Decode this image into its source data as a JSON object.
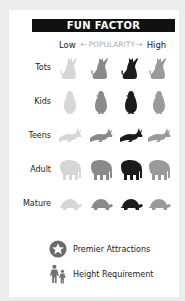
{
  "title": "FUN FACTOR",
  "scale": {
    "low": "Low",
    "middle": "POPULARITY",
    "high": "High",
    "left_arrow": "←",
    "right_arrow": "→"
  },
  "shades": [
    "#d6d6d6",
    "#8a8a8a",
    "#1c1c1c",
    "#9a9a9a"
  ],
  "rows": [
    {
      "label": "Tots",
      "icon": "cat-icon"
    },
    {
      "label": "Kids",
      "icon": "penguin-icon"
    },
    {
      "label": "Teens",
      "icon": "rabbit-icon"
    },
    {
      "label": "Adult",
      "icon": "elephant-icon"
    },
    {
      "label": "Mature",
      "icon": "turtle-icon"
    }
  ],
  "legend": [
    {
      "icon": "star-badge-icon",
      "label": "Premier Attractions"
    },
    {
      "icon": "adult-child-icon",
      "label": "Height Requirement"
    }
  ]
}
